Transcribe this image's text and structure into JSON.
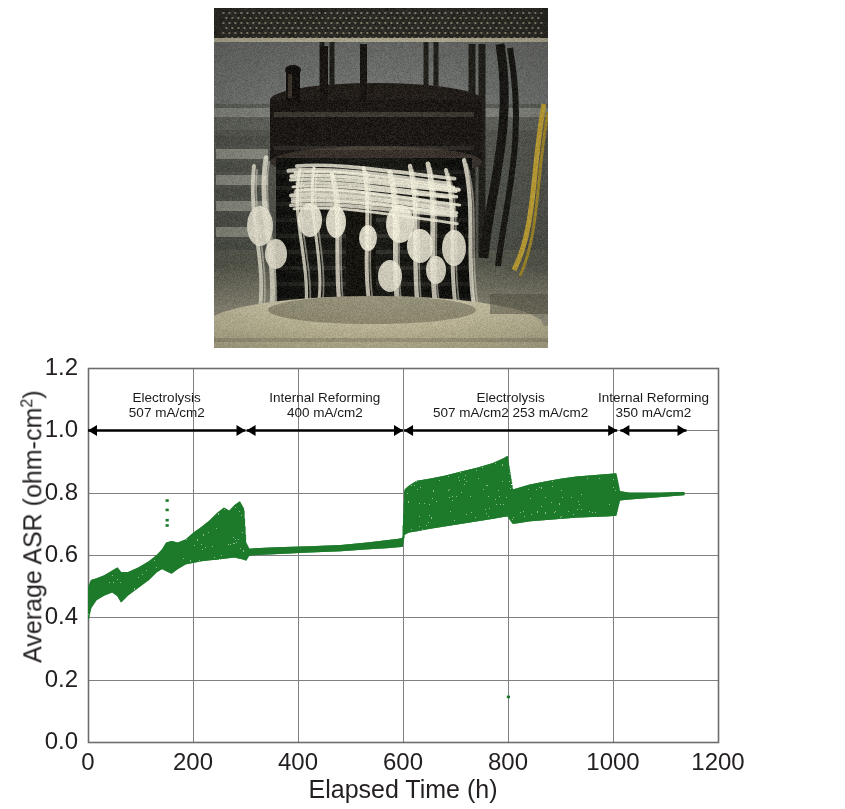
{
  "figure": {
    "photo": {
      "name": "stack-test-rig-photograph",
      "caption": "",
      "description": "Solid oxide cell stack mounted in test furnace with ceramic insulation fibers and instrumentation tubing"
    }
  },
  "chart_data": {
    "type": "line",
    "title": "",
    "xlabel": "Elapsed Time (h)",
    "ylabel_text": "Average ASR (ohm-cm",
    "ylabel_sup": "2",
    "ylabel_tail": ")",
    "xlim": [
      0,
      1200
    ],
    "ylim": [
      0.0,
      1.2
    ],
    "xticks": [
      0,
      200,
      400,
      600,
      800,
      1000,
      1200
    ],
    "xtick_labels": [
      "0",
      "200",
      "400",
      "600",
      "800",
      "1000",
      "1200"
    ],
    "yticks": [
      0.0,
      0.2,
      0.4,
      0.6,
      0.8,
      1.0,
      1.2
    ],
    "ytick_labels": [
      "0.0",
      "0.2",
      "0.4",
      "0.6",
      "0.8",
      "1.0",
      "1.2"
    ],
    "grid": true,
    "grid_color": "#808080",
    "legend": "none",
    "series_color": "#1d7a2a",
    "series_name": "Average ASR",
    "band_points": [
      {
        "x": 0,
        "lo": 0.395,
        "hi": 0.5
      },
      {
        "x": 5,
        "lo": 0.43,
        "hi": 0.52
      },
      {
        "x": 15,
        "lo": 0.455,
        "hi": 0.525
      },
      {
        "x": 30,
        "lo": 0.47,
        "hi": 0.535
      },
      {
        "x": 45,
        "lo": 0.48,
        "hi": 0.55
      },
      {
        "x": 55,
        "lo": 0.468,
        "hi": 0.56
      },
      {
        "x": 62,
        "lo": 0.448,
        "hi": 0.545
      },
      {
        "x": 75,
        "lo": 0.47,
        "hi": 0.545
      },
      {
        "x": 95,
        "lo": 0.495,
        "hi": 0.56
      },
      {
        "x": 115,
        "lo": 0.52,
        "hi": 0.58
      },
      {
        "x": 130,
        "lo": 0.545,
        "hi": 0.6
      },
      {
        "x": 140,
        "lo": 0.555,
        "hi": 0.618
      },
      {
        "x": 148,
        "lo": 0.548,
        "hi": 0.64
      },
      {
        "x": 158,
        "lo": 0.54,
        "hi": 0.645
      },
      {
        "x": 170,
        "lo": 0.555,
        "hi": 0.64
      },
      {
        "x": 185,
        "lo": 0.57,
        "hi": 0.65
      },
      {
        "x": 200,
        "lo": 0.575,
        "hi": 0.672
      },
      {
        "x": 215,
        "lo": 0.58,
        "hi": 0.69
      },
      {
        "x": 230,
        "lo": 0.583,
        "hi": 0.71
      },
      {
        "x": 245,
        "lo": 0.585,
        "hi": 0.735
      },
      {
        "x": 258,
        "lo": 0.588,
        "hi": 0.752
      },
      {
        "x": 268,
        "lo": 0.59,
        "hi": 0.742
      },
      {
        "x": 278,
        "lo": 0.592,
        "hi": 0.76
      },
      {
        "x": 288,
        "lo": 0.588,
        "hi": 0.772
      },
      {
        "x": 296,
        "lo": 0.585,
        "hi": 0.748
      },
      {
        "x": 300,
        "lo": 0.582,
        "hi": 0.64
      },
      {
        "x": 306,
        "lo": 0.598,
        "hi": 0.62
      },
      {
        "x": 320,
        "lo": 0.6,
        "hi": 0.622
      },
      {
        "x": 360,
        "lo": 0.603,
        "hi": 0.625
      },
      {
        "x": 420,
        "lo": 0.608,
        "hi": 0.628
      },
      {
        "x": 480,
        "lo": 0.612,
        "hi": 0.632
      },
      {
        "x": 530,
        "lo": 0.618,
        "hi": 0.64
      },
      {
        "x": 570,
        "lo": 0.622,
        "hi": 0.648
      },
      {
        "x": 590,
        "lo": 0.625,
        "hi": 0.652
      },
      {
        "x": 598,
        "lo": 0.626,
        "hi": 0.655
      },
      {
        "x": 602,
        "lo": 0.665,
        "hi": 0.81
      },
      {
        "x": 610,
        "lo": 0.672,
        "hi": 0.822
      },
      {
        "x": 625,
        "lo": 0.676,
        "hi": 0.838
      },
      {
        "x": 650,
        "lo": 0.684,
        "hi": 0.845
      },
      {
        "x": 680,
        "lo": 0.692,
        "hi": 0.855
      },
      {
        "x": 710,
        "lo": 0.7,
        "hi": 0.868
      },
      {
        "x": 740,
        "lo": 0.708,
        "hi": 0.88
      },
      {
        "x": 770,
        "lo": 0.716,
        "hi": 0.895
      },
      {
        "x": 790,
        "lo": 0.722,
        "hi": 0.91
      },
      {
        "x": 798,
        "lo": 0.724,
        "hi": 0.918
      },
      {
        "x": 808,
        "lo": 0.7,
        "hi": 0.81
      },
      {
        "x": 818,
        "lo": 0.702,
        "hi": 0.815
      },
      {
        "x": 840,
        "lo": 0.708,
        "hi": 0.826
      },
      {
        "x": 870,
        "lo": 0.712,
        "hi": 0.836
      },
      {
        "x": 900,
        "lo": 0.716,
        "hi": 0.845
      },
      {
        "x": 930,
        "lo": 0.72,
        "hi": 0.852
      },
      {
        "x": 960,
        "lo": 0.722,
        "hi": 0.856
      },
      {
        "x": 990,
        "lo": 0.724,
        "hi": 0.86
      },
      {
        "x": 1005,
        "lo": 0.726,
        "hi": 0.862
      },
      {
        "x": 1012,
        "lo": 0.775,
        "hi": 0.805
      },
      {
        "x": 1030,
        "lo": 0.778,
        "hi": 0.8
      },
      {
        "x": 1060,
        "lo": 0.782,
        "hi": 0.8
      },
      {
        "x": 1090,
        "lo": 0.786,
        "hi": 0.8
      },
      {
        "x": 1120,
        "lo": 0.79,
        "hi": 0.802
      },
      {
        "x": 1135,
        "lo": 0.792,
        "hi": 0.802
      }
    ],
    "outlier_points": [
      {
        "x": 150,
        "y": 0.775
      },
      {
        "x": 150,
        "y": 0.745
      },
      {
        "x": 150,
        "y": 0.712
      },
      {
        "x": 150,
        "y": 0.695
      },
      {
        "x": 800,
        "y": 0.145
      }
    ],
    "annotations": [
      {
        "id": "phase-1",
        "label": "Electrolysis",
        "current": "507 mA/cm2",
        "x_start": 0,
        "x_end": 300,
        "arrow": "both"
      },
      {
        "id": "phase-2",
        "label": "Internal Reforming",
        "current": "400 mA/cm2",
        "x_start": 302,
        "x_end": 600,
        "arrow": "both"
      },
      {
        "id": "phase-3",
        "label": "Electrolysis",
        "current": "507 mA/cm2  253 mA/cm2",
        "x_start": 602,
        "x_end": 1008,
        "arrow": "both"
      },
      {
        "id": "phase-4",
        "label": "Internal Reforming",
        "current": "350 mA/cm2",
        "x_start": 1014,
        "x_end": 1140,
        "arrow": "both"
      }
    ],
    "annotation_y": 1.0
  }
}
